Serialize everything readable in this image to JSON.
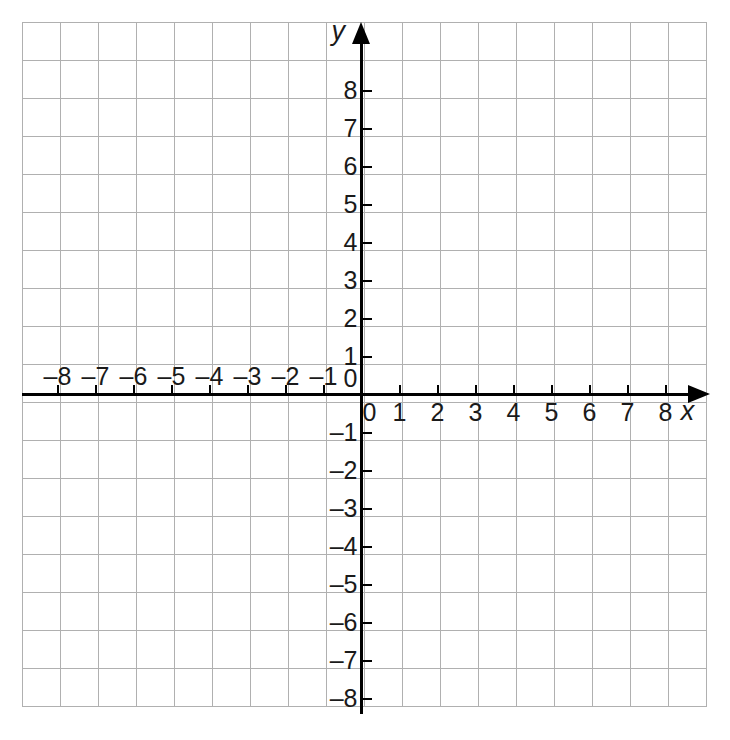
{
  "figure": {
    "type": "coordinate-grid",
    "title": "",
    "background_color": "#ffffff",
    "grid_color": "#b0b0b0",
    "axis_color": "#000000",
    "label_color": "#1a1a1a"
  },
  "axes": {
    "x": {
      "name": "x",
      "min": -9,
      "max": 9,
      "tick_labels": [
        "–8",
        "–7",
        "–6",
        "–5",
        "–4",
        "–3",
        "–2",
        "–1",
        "0",
        "1",
        "2",
        "3",
        "4",
        "5",
        "6",
        "7",
        "8"
      ],
      "tick_values": [
        -8,
        -7,
        -6,
        -5,
        -4,
        -3,
        -2,
        -1,
        0,
        1,
        2,
        3,
        4,
        5,
        6,
        7,
        8
      ],
      "arrow": "right"
    },
    "y": {
      "name": "y",
      "min": -9,
      "max": 9,
      "tick_labels": [
        "8",
        "7",
        "6",
        "5",
        "4",
        "3",
        "2",
        "1",
        "0",
        "–1",
        "–2",
        "–3",
        "–4",
        "–5",
        "–6",
        "–7",
        "–8"
      ],
      "tick_values": [
        8,
        7,
        6,
        5,
        4,
        3,
        2,
        1,
        0,
        -1,
        -2,
        -3,
        -4,
        -5,
        -6,
        -7,
        -8
      ],
      "arrow": "up"
    }
  },
  "chart_data": {
    "type": "scatter",
    "title": "",
    "xlabel": "x",
    "ylabel": "y",
    "xlim": [
      -9,
      9
    ],
    "ylim": [
      -9,
      9
    ],
    "grid": true,
    "legend": "none",
    "x_ticks": [
      -8,
      -7,
      -6,
      -5,
      -4,
      -3,
      -2,
      -1,
      0,
      1,
      2,
      3,
      4,
      5,
      6,
      7,
      8
    ],
    "y_ticks": [
      -8,
      -7,
      -6,
      -5,
      -4,
      -3,
      -2,
      -1,
      0,
      1,
      2,
      3,
      4,
      5,
      6,
      7,
      8
    ],
    "series": [],
    "x": [],
    "y": [],
    "annotations": []
  }
}
